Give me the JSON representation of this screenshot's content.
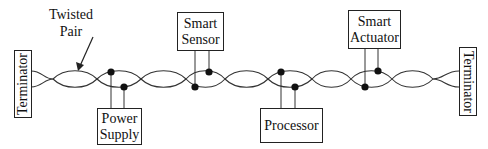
{
  "diagram": {
    "bus": {
      "label_line1": "Twisted",
      "label_line2": "Pair",
      "wire_color": "#333333"
    },
    "terminators": [
      {
        "label": "Terminator",
        "side": "left"
      },
      {
        "label": "Terminator",
        "side": "right"
      }
    ],
    "nodes": [
      {
        "id": "power-supply",
        "line1": "Power",
        "line2": "Supply",
        "position": "below"
      },
      {
        "id": "smart-sensor",
        "line1": "Smart",
        "line2": "Sensor",
        "position": "above"
      },
      {
        "id": "processor",
        "line1": "Processor",
        "line2": "",
        "position": "below"
      },
      {
        "id": "smart-actuator",
        "line1": "Smart",
        "line2": "Actuator",
        "position": "above"
      }
    ]
  }
}
